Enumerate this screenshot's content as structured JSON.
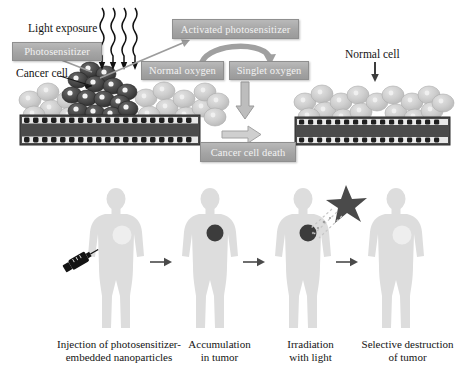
{
  "figure": {
    "title_visible": false,
    "panels": [
      "mechanism-panel",
      "treatment-timeline-panel"
    ]
  },
  "mechanism": {
    "labels": {
      "light_exposure": "Light exposure",
      "cancer_cell": "Cancer cell",
      "normal_cell": "Normal cell"
    },
    "boxes": [
      {
        "id": "photosensitizer",
        "text": "Photosensitizer"
      },
      {
        "id": "activated-photosensitizer",
        "text": "Activated photosensitizer"
      },
      {
        "id": "normal-oxygen",
        "text": "Normal oxygen"
      },
      {
        "id": "singlet-oxygen",
        "text": "Singlet oxygen"
      },
      {
        "id": "cancer-cell-death",
        "text": "Cancer cell death"
      }
    ],
    "arrows": [
      {
        "id": "light-wave-arrows",
        "count": 4,
        "style": "wavy-down"
      },
      {
        "id": "activation-arrow",
        "style": "straight-diagonal-up-right"
      },
      {
        "id": "oxygen-conversion-arrow",
        "style": "curved-right"
      },
      {
        "id": "singlet-to-death-arrow",
        "style": "block-down"
      },
      {
        "id": "death-horizontal-arrow",
        "style": "block-right"
      },
      {
        "id": "normal-cell-pointer",
        "style": "thin-down"
      },
      {
        "id": "cancer-cell-pointer",
        "style": "thin-diagonal"
      },
      {
        "id": "photosensitizer-pointer",
        "style": "thin-diagonal"
      }
    ]
  },
  "timeline": {
    "steps": [
      {
        "id": "injection",
        "caption_line1": "Injection of photosensitizer-",
        "caption_line2": "embedded nanoparticles",
        "marker": "light-spot"
      },
      {
        "id": "accumulation",
        "caption_line1": "Accumulation",
        "caption_line2": "in tumor",
        "marker": "dark-tumor"
      },
      {
        "id": "irradiation",
        "caption_line1": "Irradiation",
        "caption_line2": "with light",
        "marker": "dark-tumor-irradiated"
      },
      {
        "id": "destruction",
        "caption_line1": "Selective destruction",
        "caption_line2": "of tumor",
        "marker": "light-spot"
      }
    ],
    "icons": {
      "syringe": "syringe-icon",
      "light_star": "light-star-icon"
    },
    "arrow_count": 3
  },
  "colors": {
    "box_fill": "#a5a5a5",
    "box_text": "#f2f2f2",
    "body_silhouette": "#dcdcdc",
    "tumor_dark": "#3a3a3a",
    "cancer_cell": "#4a4a4a",
    "normal_cell": "#c9c9c9",
    "membrane": "#4d4d4d",
    "arrow_grey": "#8c8c8c",
    "text": "#141414",
    "background": "#ffffff"
  }
}
